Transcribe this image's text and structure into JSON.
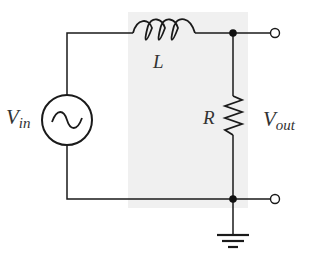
{
  "diagram": {
    "type": "circuit",
    "labels": {
      "source": "V",
      "source_sub": "in",
      "inductor": "L",
      "resistor": "R",
      "output": "V",
      "output_sub": "out"
    },
    "components": [
      {
        "id": "source",
        "kind": "ac-voltage-source",
        "label": "Vin"
      },
      {
        "id": "inductor",
        "kind": "inductor",
        "label": "L"
      },
      {
        "id": "resistor",
        "kind": "resistor",
        "label": "R"
      },
      {
        "id": "ground",
        "kind": "ground"
      }
    ],
    "colors": {
      "wire": "#1a1a1a",
      "shade": "#f0f0f0",
      "text": "#333333"
    }
  }
}
